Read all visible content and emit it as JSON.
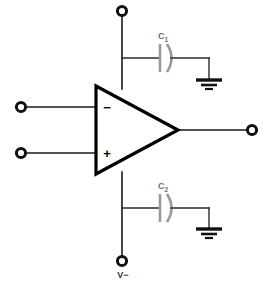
{
  "diagram": {
    "type": "circuit-schematic",
    "background_color": "#ffffff"
  },
  "amplifier": {
    "symbol": "triangle",
    "name": "op-amp",
    "inverting_input_sign": "−",
    "noninverting_input_sign": "+",
    "outline_color": "#000000"
  },
  "terminals": {
    "positive_supply": {
      "name": "positive-supply-terminal",
      "label": ""
    },
    "negative_supply": {
      "name": "negative-supply-terminal",
      "label": "V−"
    },
    "inverting_input": {
      "name": "inverting-input-terminal",
      "label": ""
    },
    "noninverting_input": {
      "name": "noninverting-input-terminal",
      "label": ""
    },
    "output": {
      "name": "output-terminal",
      "label": ""
    }
  },
  "capacitors": [
    {
      "name": "capacitor-c1",
      "designator": "C",
      "subscript": "1",
      "label": "C₁",
      "color": "#9a9a9a",
      "position": "top"
    },
    {
      "name": "capacitor-c2",
      "designator": "C",
      "subscript": "2",
      "label": "C₂",
      "color": "#9a9a9a",
      "position": "bottom"
    }
  ],
  "grounds": [
    {
      "name": "ground-symbol-top",
      "bars": 3
    },
    {
      "name": "ground-symbol-bottom",
      "bars": 3
    }
  ]
}
